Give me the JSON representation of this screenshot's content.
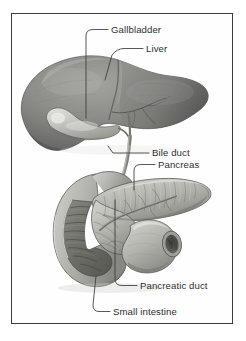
{
  "figure": {
    "frame_color": "#3b3b3b",
    "background_color": "#ffffff",
    "style": "grayscale medical illustration",
    "labels": [
      {
        "id": "gallbladder",
        "text": "Gallbladder",
        "text_x": 111,
        "text_y": 33,
        "anchor": "start",
        "leader_path": "M 108 29.5 L 93 29.5 Q 86 29.5 86 36 L 86 118",
        "target": "gallbladder-organ"
      },
      {
        "id": "liver",
        "text": "Liver",
        "text_x": 146,
        "text_y": 52,
        "anchor": "start",
        "leader_path": "M 143 48.5 L 124 48.5 Q 117 48.5 112 55 L 105 80",
        "target": "liver-organ"
      },
      {
        "id": "bile-duct",
        "text": "Bile duct",
        "text_x": 152,
        "text_y": 156,
        "anchor": "start",
        "leader_path": "M 149 153 L 113 153 L 108 146",
        "target": "bile-duct-structure"
      },
      {
        "id": "pancreas",
        "text": "Pancreas",
        "text_x": 158,
        "text_y": 168,
        "anchor": "start",
        "leader_path": "M 155 164.5 L 141 164.5 Q 134 164.5 134 171 L 134 190",
        "target": "pancreas-organ"
      },
      {
        "id": "pancreatic-duct",
        "text": "Pancreatic duct",
        "text_x": 140,
        "text_y": 289,
        "anchor": "start",
        "leader_path": "M 137 285.5 L 122 285.5 Q 115 285.5 115 279 L 115 200",
        "target": "pancreatic-duct-structure"
      },
      {
        "id": "small-intestine",
        "text": "Small intestine",
        "text_x": 113,
        "text_y": 315,
        "anchor": "start",
        "leader_path": "M 110 311.5 L 99 311.5 Q 93 311.5 93 305 L 96 276",
        "target": "duodenum-organ"
      }
    ],
    "organs": [
      {
        "id": "liver-organ",
        "name": "Liver",
        "fill": "#8d8d8d",
        "outline": "#4a4a4a"
      },
      {
        "id": "gallbladder-organ",
        "name": "Gallbladder",
        "fill": "#c9c9c4",
        "outline": "#555555"
      },
      {
        "id": "bile-duct-structure",
        "name": "Bile duct",
        "fill": "#b3b3ad",
        "outline": "#4f4f4f"
      },
      {
        "id": "pancreas-organ",
        "name": "Pancreas",
        "fill": "#b8b8b2",
        "outline": "#4f4f4f"
      },
      {
        "id": "pancreatic-duct-structure",
        "name": "Pancreatic duct",
        "fill": "#9a9a94",
        "outline": "#3f3f3f"
      },
      {
        "id": "duodenum-organ",
        "name": "Small intestine",
        "fill": "#bdbdb7",
        "outline": "#4a4a4a"
      }
    ]
  }
}
